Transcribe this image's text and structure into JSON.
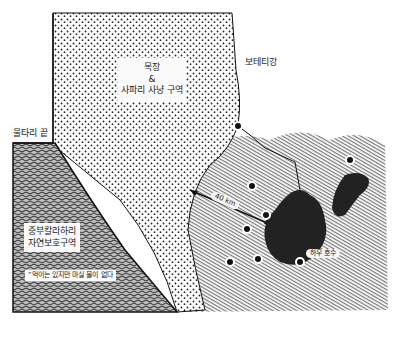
{
  "map": {
    "regions": [
      {
        "id": "ranch-safari",
        "label_lines": [
          "목장",
          "&",
          "사파리 사냥 구역"
        ],
        "pattern": "dots"
      },
      {
        "id": "central-kalahari",
        "label_lines": [
          "중부칼라하리",
          "자연보호구역"
        ],
        "pattern": "squiggle"
      },
      {
        "id": "lake-area",
        "pattern": "diagonal-hatch"
      }
    ],
    "labels": {
      "ranch_line1": "목장",
      "ranch_line2": "&",
      "ranch_line3": "사파리 사냥 구역",
      "fence_end": "울타리 끝",
      "river": "보테티강",
      "reserve_line1": "중부칼라하리",
      "reserve_line2": "자연보호구역",
      "reserve_note": "“먹이는 있지만 마실 물이 없다",
      "distance": "40 km",
      "lake": "하우 호수"
    },
    "water_points_count": 8,
    "colors": {
      "ink": "#1a1a1a",
      "lake": "#222222",
      "background": "#ffffff"
    }
  }
}
